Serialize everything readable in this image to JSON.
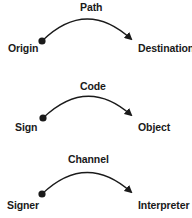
{
  "diagrams": [
    {
      "relation": "Path",
      "source": "Origin",
      "target": "Destination"
    },
    {
      "relation": "Code",
      "source": "Sign",
      "target": "Object"
    },
    {
      "relation": "Channel",
      "source": "Signer",
      "target": "Interpreter"
    }
  ],
  "colors": {
    "ink": "#1a1a1a",
    "background": "#ffffff"
  }
}
